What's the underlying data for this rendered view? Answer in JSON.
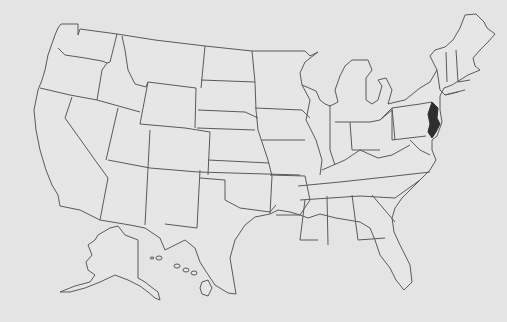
{
  "map": {
    "title": "United States",
    "background": "#e4e4e4",
    "border_color": "#5a5a5a",
    "highlight_color": "#2e2e2e",
    "highlighted_state": "New Jersey",
    "insets": [
      "Alaska",
      "Hawaii"
    ],
    "labels_visible": false
  }
}
